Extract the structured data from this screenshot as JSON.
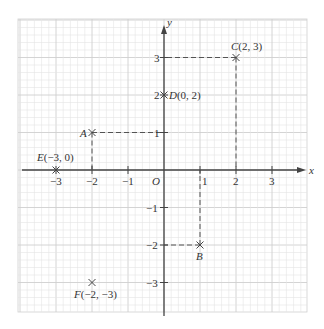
{
  "diagram": {
    "type": "coordinate-grid",
    "axes": {
      "x_label": "x",
      "y_label": "y",
      "origin_label": "O",
      "x_ticks": [
        {
          "value": -3,
          "label": "−3"
        },
        {
          "value": -2,
          "label": "−2"
        },
        {
          "value": -1,
          "label": "−1"
        },
        {
          "value": 1,
          "label": "1"
        },
        {
          "value": 2,
          "label": "2"
        },
        {
          "value": 3,
          "label": "3"
        }
      ],
      "y_ticks": [
        {
          "value": 3,
          "label": "3"
        },
        {
          "value": 2,
          "label": "2"
        },
        {
          "value": 1,
          "label": "1"
        },
        {
          "value": -1,
          "label": "−1"
        },
        {
          "value": -2,
          "label": "−2"
        },
        {
          "value": -3,
          "label": "−3"
        }
      ]
    },
    "points": [
      {
        "name": "A",
        "x": -2,
        "y": 1,
        "label": "A",
        "coords_text": "",
        "dashed_guides": true
      },
      {
        "name": "B",
        "x": 1,
        "y": -2,
        "label": "B",
        "coords_text": "",
        "dashed_guides": true
      },
      {
        "name": "C",
        "x": 2,
        "y": 3,
        "label": "C",
        "coords_text": "(2, 3)",
        "dashed_guides": true
      },
      {
        "name": "D",
        "x": 0,
        "y": 2,
        "label": "D",
        "coords_text": "(0, 2)",
        "dashed_guides": false
      },
      {
        "name": "E",
        "x": -3,
        "y": 0,
        "label": "E",
        "coords_text": "(−3, 0)",
        "dashed_guides": false
      },
      {
        "name": "F",
        "x": -2,
        "y": -3,
        "label": "F",
        "coords_text": "(−2, −3)",
        "dashed_guides": false
      }
    ],
    "colors": {
      "grid_minor": "#e4e4e4",
      "grid_major": "#cfcfcf",
      "axis": "#444444",
      "marker": "#444444",
      "text": "#333333"
    }
  }
}
